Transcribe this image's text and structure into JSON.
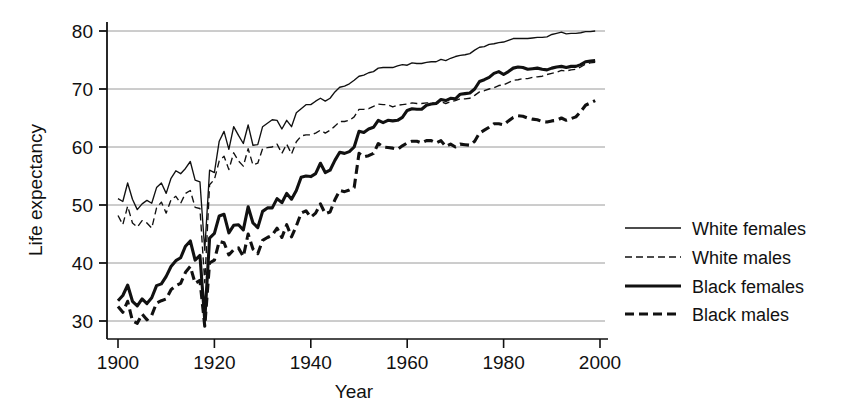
{
  "chart_data": {
    "type": "line",
    "title": "",
    "xlabel": "Year",
    "ylabel": "Life expectancy",
    "xlim": [
      1900,
      2000
    ],
    "ylim": [
      28,
      82
    ],
    "xticks": [
      1900,
      1920,
      1940,
      1960,
      1980,
      2000
    ],
    "yticks": [
      30,
      40,
      50,
      60,
      70,
      80
    ],
    "grid": "horizontal",
    "legend_position": "right",
    "x": [
      1900,
      1901,
      1902,
      1903,
      1904,
      1905,
      1906,
      1907,
      1908,
      1909,
      1910,
      1911,
      1912,
      1913,
      1914,
      1915,
      1916,
      1917,
      1918,
      1919,
      1920,
      1921,
      1922,
      1923,
      1924,
      1925,
      1926,
      1927,
      1928,
      1929,
      1930,
      1931,
      1932,
      1933,
      1934,
      1935,
      1936,
      1937,
      1938,
      1939,
      1940,
      1941,
      1942,
      1943,
      1944,
      1945,
      1946,
      1947,
      1948,
      1949,
      1950,
      1951,
      1952,
      1953,
      1954,
      1955,
      1956,
      1957,
      1958,
      1959,
      1960,
      1961,
      1962,
      1963,
      1964,
      1965,
      1966,
      1967,
      1968,
      1969,
      1970,
      1971,
      1972,
      1973,
      1974,
      1975,
      1976,
      1977,
      1978,
      1979,
      1980,
      1981,
      1982,
      1983,
      1984,
      1985,
      1986,
      1987,
      1988,
      1989,
      1990,
      1991,
      1992,
      1993,
      1994,
      1995,
      1996,
      1997,
      1998,
      1999
    ],
    "series": [
      {
        "name": "White females",
        "style": "solid",
        "width": "thin",
        "color": "#111111",
        "values": [
          51.1,
          50.6,
          53.8,
          51.0,
          49.2,
          50.2,
          50.8,
          50.3,
          53.0,
          53.8,
          52.0,
          54.6,
          55.9,
          55.4,
          56.3,
          57.5,
          54.3,
          54.0,
          42.2,
          56.0,
          55.6,
          61.0,
          62.7,
          59.6,
          63.5,
          62.0,
          60.6,
          63.8,
          60.3,
          60.4,
          63.5,
          64.1,
          64.7,
          64.6,
          63.1,
          64.6,
          63.5,
          65.9,
          66.6,
          67.3,
          67.3,
          67.9,
          68.4,
          67.9,
          68.4,
          69.5,
          70.3,
          70.5,
          70.9,
          71.5,
          72.2,
          72.4,
          72.8,
          73.0,
          73.6,
          73.7,
          73.7,
          73.7,
          74.0,
          74.2,
          74.1,
          74.5,
          74.4,
          74.4,
          74.6,
          74.7,
          74.7,
          75.1,
          74.9,
          75.3,
          75.6,
          75.8,
          75.9,
          76.1,
          76.7,
          77.2,
          77.3,
          77.7,
          77.8,
          78.0,
          78.1,
          78.4,
          78.7,
          78.7,
          78.7,
          78.7,
          78.8,
          78.9,
          78.9,
          79.0,
          79.4,
          79.6,
          79.8,
          79.5,
          79.6,
          79.6,
          79.7,
          79.9,
          79.9,
          80.0
        ]
      },
      {
        "name": "White males",
        "style": "dashed",
        "width": "thin",
        "color": "#111111",
        "values": [
          48.2,
          46.6,
          49.8,
          46.9,
          46.2,
          47.3,
          46.9,
          46.0,
          49.5,
          50.5,
          48.6,
          50.9,
          51.5,
          50.3,
          52.0,
          52.5,
          49.6,
          49.4,
          36.6,
          53.5,
          54.4,
          57.6,
          58.4,
          56.1,
          59.0,
          57.6,
          56.7,
          59.7,
          56.9,
          57.2,
          59.7,
          59.9,
          60.0,
          60.5,
          58.9,
          60.5,
          58.8,
          60.9,
          61.9,
          62.1,
          62.1,
          62.4,
          62.9,
          62.4,
          62.9,
          63.6,
          64.4,
          64.4,
          64.6,
          65.2,
          66.5,
          66.5,
          66.6,
          67.0,
          67.4,
          67.3,
          67.3,
          66.9,
          67.2,
          67.3,
          67.4,
          67.6,
          67.5,
          67.5,
          67.6,
          67.6,
          67.5,
          67.8,
          67.5,
          67.8,
          68.0,
          68.3,
          68.3,
          68.4,
          68.9,
          69.5,
          69.7,
          70.0,
          70.2,
          70.6,
          70.7,
          71.1,
          71.5,
          71.6,
          71.8,
          71.8,
          72.0,
          72.1,
          72.2,
          72.5,
          72.7,
          72.9,
          73.2,
          73.1,
          73.3,
          73.4,
          73.8,
          74.3,
          74.5,
          74.6
        ]
      },
      {
        "name": "Black females",
        "style": "solid",
        "width": "thick",
        "color": "#111111",
        "values": [
          33.5,
          34.4,
          36.2,
          33.4,
          32.6,
          33.8,
          33.0,
          34.0,
          36.1,
          36.4,
          37.7,
          39.4,
          40.4,
          40.9,
          42.9,
          43.8,
          40.5,
          41.3,
          30.1,
          44.3,
          45.1,
          48.1,
          48.4,
          45.2,
          46.5,
          46.6,
          45.7,
          49.7,
          46.9,
          46.1,
          48.9,
          49.5,
          49.5,
          51.1,
          50.4,
          52.0,
          51.0,
          52.5,
          54.8,
          55.0,
          54.9,
          55.4,
          57.2,
          55.6,
          56.0,
          57.7,
          59.1,
          58.9,
          59.2,
          60.0,
          62.7,
          62.5,
          63.1,
          63.4,
          64.6,
          64.2,
          64.6,
          64.5,
          64.6,
          65.1,
          66.3,
          66.6,
          66.5,
          66.5,
          67.2,
          67.4,
          67.5,
          68.2,
          68.0,
          68.4,
          68.3,
          69.1,
          69.2,
          69.3,
          70.0,
          71.3,
          71.6,
          72.0,
          72.7,
          73.0,
          72.5,
          73.0,
          73.6,
          73.8,
          73.7,
          73.4,
          73.5,
          73.6,
          73.4,
          73.3,
          73.6,
          73.8,
          73.9,
          73.7,
          73.9,
          73.9,
          74.2,
          74.7,
          74.8,
          74.9
        ]
      },
      {
        "name": "Black males",
        "style": "dashed",
        "width": "thick",
        "color": "#111111",
        "values": [
          32.5,
          31.5,
          33.4,
          30.0,
          29.6,
          31.2,
          30.2,
          31.0,
          33.1,
          33.5,
          33.8,
          35.4,
          36.1,
          36.5,
          38.4,
          39.4,
          36.5,
          37.0,
          29.1,
          40.0,
          40.5,
          43.7,
          43.5,
          41.4,
          42.3,
          42.6,
          41.1,
          45.0,
          42.4,
          41.6,
          43.9,
          44.4,
          44.8,
          46.0,
          44.4,
          46.6,
          44.5,
          46.4,
          48.6,
          49.0,
          47.9,
          48.6,
          50.2,
          48.5,
          48.8,
          50.9,
          52.5,
          52.3,
          52.6,
          53.0,
          58.9,
          58.3,
          58.5,
          58.9,
          60.6,
          60.0,
          59.9,
          59.8,
          59.6,
          60.2,
          60.7,
          61.0,
          61.0,
          60.7,
          61.1,
          61.1,
          60.7,
          61.1,
          60.1,
          60.5,
          60.0,
          60.5,
          60.4,
          60.3,
          61.0,
          62.4,
          62.9,
          63.4,
          64.0,
          64.0,
          63.8,
          64.5,
          65.1,
          65.4,
          65.3,
          65.0,
          64.8,
          64.7,
          64.4,
          64.3,
          64.5,
          64.6,
          65.0,
          64.6,
          64.9,
          65.2,
          66.1,
          67.2,
          67.6,
          68.0
        ]
      }
    ]
  },
  "axes": {
    "y_label": "Life expectancy",
    "x_label": "Year",
    "x_tick_labels": [
      "1900",
      "1920",
      "1940",
      "1960",
      "1980",
      "2000"
    ],
    "y_tick_labels": [
      "30",
      "40",
      "50",
      "60",
      "70",
      "80"
    ]
  },
  "legend": {
    "entries": [
      {
        "label": "White females",
        "style": "solid",
        "width": "thin"
      },
      {
        "label": "White males",
        "style": "dashed",
        "width": "thin"
      },
      {
        "label": "Black females",
        "style": "solid",
        "width": "thick"
      },
      {
        "label": "Black males",
        "style": "dashed",
        "width": "thick"
      }
    ]
  },
  "colors": {
    "line": "#111111",
    "grid": "#9a9a9a",
    "axis": "#111111",
    "background": "#ffffff"
  }
}
